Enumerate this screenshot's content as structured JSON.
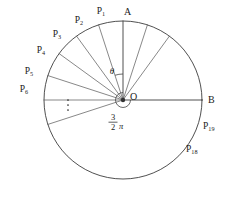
{
  "figure": {
    "center_label": "O",
    "start_point_label": "A",
    "end_point_label": "B",
    "angle_label": "θ",
    "ellipsis": "⋮",
    "total_angle": {
      "numerator": "3",
      "denominator": "2",
      "symbol": "π"
    },
    "stroke_color": "#3c3c3c",
    "thin_stroke_color": "#555555",
    "text_color": "#1a1a1a",
    "background": "#ffffff"
  },
  "geometry": {
    "center_x": 123,
    "center_y": 100,
    "radius": 79,
    "sector_count": 20,
    "sector_angle_deg": 18,
    "start_angle_deg": 90,
    "sweep_direction": "counterclockwise"
  },
  "points": [
    {
      "base": "P",
      "sub": "1",
      "x": 101,
      "y": 14,
      "anchor": "middle"
    },
    {
      "base": "P",
      "sub": "2",
      "x": 79,
      "y": 23,
      "anchor": "middle"
    },
    {
      "base": "P",
      "sub": "3",
      "x": 57,
      "y": 37,
      "anchor": "middle"
    },
    {
      "base": "P",
      "sub": "4",
      "x": 41,
      "y": 53,
      "anchor": "middle"
    },
    {
      "base": "P",
      "sub": "5",
      "x": 29,
      "y": 74,
      "anchor": "middle"
    },
    {
      "base": "P",
      "sub": "6",
      "x": 24,
      "y": 92,
      "anchor": "middle"
    },
    {
      "base": "P",
      "sub": "19",
      "x": 203,
      "y": 129,
      "anchor": "start"
    },
    {
      "base": "P",
      "sub": "18",
      "x": 186,
      "y": 152,
      "anchor": "start"
    }
  ],
  "vertices": [
    {
      "label": "A",
      "x": 124,
      "y": 15,
      "anchor": "start"
    },
    {
      "label": "O",
      "x": 130,
      "y": 100,
      "anchor": "start"
    },
    {
      "label": "B",
      "x": 208,
      "y": 103,
      "anchor": "start"
    }
  ],
  "annotations": {
    "theta": {
      "x": 112,
      "y": 74
    },
    "ellipsis": {
      "x": 68,
      "y": 106
    },
    "fraction": {
      "x": 113,
      "y": 120
    }
  }
}
